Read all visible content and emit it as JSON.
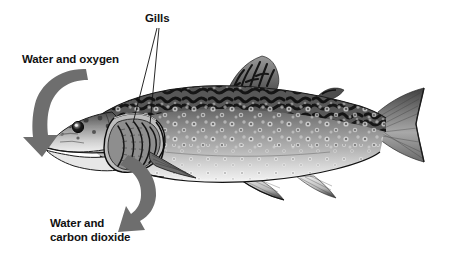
{
  "diagram": {
    "background_color": "#ffffff",
    "labels": [
      {
        "id": "gills",
        "text": "Gills",
        "x": 145,
        "y": 22,
        "anchor": "start",
        "lines": 1
      },
      {
        "id": "water-and-oxygen",
        "text": "Water and oxygen",
        "x": 22,
        "y": 63,
        "anchor": "start",
        "lines": 1
      },
      {
        "id": "water-and-carbon-dioxide-line1",
        "text": "Water and",
        "x": 50,
        "y": 227,
        "anchor": "start",
        "lines": 1
      },
      {
        "id": "water-and-carbon-dioxide-line2",
        "text": "carbon dioxide",
        "x": 50,
        "y": 241,
        "anchor": "start",
        "lines": 1
      }
    ],
    "leader_lines": [
      {
        "id": "gills-leader-left",
        "x1": 157,
        "y1": 28,
        "x2": 133,
        "y2": 123
      },
      {
        "id": "gills-leader-right",
        "x1": 159,
        "y1": 28,
        "x2": 150,
        "y2": 124
      }
    ],
    "arrows": [
      {
        "id": "intake-arrow",
        "meaning": "water and oxygen entering mouth",
        "color": "#6e6e6e",
        "direction": "down-left",
        "tip_x": 42,
        "tip_y": 150
      },
      {
        "id": "outflow-arrow",
        "meaning": "water and carbon dioxide leaving gills",
        "color": "#6e6e6e",
        "direction": "down-left",
        "tip_x": 124,
        "tip_y": 224
      }
    ],
    "colors": {
      "arrow_gray": "#6e6e6e",
      "text_black": "#111111",
      "leader_black": "#101010",
      "body_dark": "#4a4a4a",
      "body_mid": "#8d8d8d",
      "body_light": "#d8d8d8",
      "belly": "#f0f0f0"
    },
    "fish": {
      "species_pattern": "vermiculated back with pale haloed spots",
      "parts": [
        "head",
        "eye",
        "mouth",
        "operculum-cutaway",
        "gill-filaments",
        "pectoral-fin",
        "pelvic-fin",
        "anal-fin",
        "dorsal-fin",
        "adipose-fin",
        "caudal-fin",
        "lateral-line"
      ]
    }
  }
}
